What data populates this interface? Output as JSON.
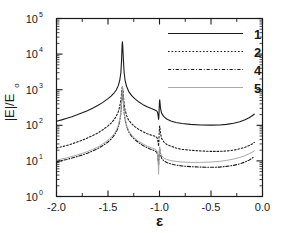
{
  "chart_data": {
    "type": "line",
    "title": "",
    "xlabel": "ε",
    "ylabel": "|E|/E",
    "ylabel_sub": "o",
    "xlim": [
      -2.0,
      0.0
    ],
    "ylim": [
      1,
      100000
    ],
    "yscale": "log",
    "xscale": "linear",
    "grid": false,
    "xticks": [
      -2.0,
      -1.5,
      -1.0,
      -0.5,
      0.0
    ],
    "xtick_labels": [
      "-2.0",
      "-1.5",
      "-1.0",
      "-0.5",
      "0.0"
    ],
    "yticks": [
      1,
      10,
      100,
      1000,
      10000,
      100000
    ],
    "ytick_labels": [
      "10",
      "10",
      "10",
      "10",
      "10",
      "10"
    ],
    "ytick_exponents": [
      "0",
      "1",
      "2",
      "3",
      "4",
      "5"
    ],
    "legend_position": "upper-right",
    "legend_entries": [
      {
        "label": "1",
        "style": "solid",
        "color": "#1a1a1a"
      },
      {
        "label": "2",
        "style": "dotted",
        "color": "#1a1a1a"
      },
      {
        "label": "4",
        "style": "dashdot",
        "color": "#1a1a1a"
      },
      {
        "label": "5",
        "style": "solid-light",
        "color": "#a8a8a8"
      }
    ],
    "resonances": [
      {
        "name": "main-peak",
        "x": -1.36,
        "peak_value": 22000
      },
      {
        "name": "secondary-peak",
        "x": -1.0,
        "peak_value": 520
      }
    ],
    "series": [
      {
        "name": "1",
        "style": "solid",
        "color": "#1a1a1a",
        "points": [
          [
            -2.0,
            130
          ],
          [
            -1.95,
            142
          ],
          [
            -1.9,
            157
          ],
          [
            -1.85,
            175
          ],
          [
            -1.8,
            197
          ],
          [
            -1.75,
            224
          ],
          [
            -1.7,
            258
          ],
          [
            -1.65,
            302
          ],
          [
            -1.6,
            360
          ],
          [
            -1.55,
            440
          ],
          [
            -1.5,
            560
          ],
          [
            -1.47,
            660
          ],
          [
            -1.44,
            820
          ],
          [
            -1.42,
            980
          ],
          [
            -1.4,
            1300
          ],
          [
            -1.385,
            1900
          ],
          [
            -1.375,
            3000
          ],
          [
            -1.368,
            7000
          ],
          [
            -1.363,
            18000
          ],
          [
            -1.36,
            22000
          ],
          [
            -1.357,
            17000
          ],
          [
            -1.35,
            6500
          ],
          [
            -1.343,
            3000
          ],
          [
            -1.335,
            1900
          ],
          [
            -1.32,
            1250
          ],
          [
            -1.3,
            900
          ],
          [
            -1.27,
            680
          ],
          [
            -1.24,
            560
          ],
          [
            -1.2,
            450
          ],
          [
            -1.16,
            380
          ],
          [
            -1.12,
            330
          ],
          [
            -1.08,
            295
          ],
          [
            -1.05,
            275
          ],
          [
            -1.035,
            262
          ],
          [
            -1.025,
            250
          ],
          [
            -1.018,
            225
          ],
          [
            -1.013,
            185
          ],
          [
            -1.009,
            145
          ],
          [
            -1.006,
            175
          ],
          [
            -1.003,
            290
          ],
          [
            -1.0,
            470
          ],
          [
            -0.998,
            520
          ],
          [
            -0.995,
            430
          ],
          [
            -0.99,
            300
          ],
          [
            -0.98,
            220
          ],
          [
            -0.96,
            178
          ],
          [
            -0.93,
            150
          ],
          [
            -0.89,
            132
          ],
          [
            -0.84,
            120
          ],
          [
            -0.78,
            112
          ],
          [
            -0.7,
            106
          ],
          [
            -0.6,
            102
          ],
          [
            -0.5,
            101
          ],
          [
            -0.42,
            102
          ],
          [
            -0.35,
            106
          ],
          [
            -0.28,
            114
          ],
          [
            -0.22,
            126
          ],
          [
            -0.17,
            143
          ],
          [
            -0.13,
            163
          ],
          [
            -0.1,
            185
          ],
          [
            -0.08,
            205
          ]
        ]
      },
      {
        "name": "2",
        "style": "dotted",
        "color": "#1a1a1a",
        "points": [
          [
            -2.0,
            23
          ],
          [
            -1.95,
            25
          ],
          [
            -1.9,
            27
          ],
          [
            -1.85,
            30
          ],
          [
            -1.8,
            34
          ],
          [
            -1.75,
            38
          ],
          [
            -1.7,
            44
          ],
          [
            -1.65,
            51
          ],
          [
            -1.6,
            61
          ],
          [
            -1.55,
            75
          ],
          [
            -1.5,
            96
          ],
          [
            -1.47,
            115
          ],
          [
            -1.44,
            145
          ],
          [
            -1.42,
            180
          ],
          [
            -1.4,
            240
          ],
          [
            -1.385,
            350
          ],
          [
            -1.375,
            520
          ],
          [
            -1.368,
            800
          ],
          [
            -1.363,
            1100
          ],
          [
            -1.36,
            1250
          ],
          [
            -1.357,
            1050
          ],
          [
            -1.35,
            650
          ],
          [
            -1.343,
            400
          ],
          [
            -1.335,
            280
          ],
          [
            -1.32,
            190
          ],
          [
            -1.3,
            140
          ],
          [
            -1.27,
            110
          ],
          [
            -1.24,
            92
          ],
          [
            -1.2,
            76
          ],
          [
            -1.16,
            66
          ],
          [
            -1.12,
            58
          ],
          [
            -1.08,
            53
          ],
          [
            -1.05,
            50
          ],
          [
            -1.035,
            48
          ],
          [
            -1.025,
            45
          ],
          [
            -1.018,
            40
          ],
          [
            -1.013,
            33
          ],
          [
            -1.009,
            26
          ],
          [
            -1.006,
            34
          ],
          [
            -1.003,
            62
          ],
          [
            -1.0,
            88
          ],
          [
            -0.998,
            96
          ],
          [
            -0.995,
            80
          ],
          [
            -0.99,
            58
          ],
          [
            -0.98,
            43
          ],
          [
            -0.96,
            35
          ],
          [
            -0.93,
            29
          ],
          [
            -0.89,
            26
          ],
          [
            -0.84,
            23
          ],
          [
            -0.78,
            21
          ],
          [
            -0.7,
            20
          ],
          [
            -0.6,
            19
          ],
          [
            -0.5,
            18.5
          ],
          [
            -0.42,
            18.5
          ],
          [
            -0.35,
            19
          ],
          [
            -0.28,
            20
          ],
          [
            -0.22,
            22
          ],
          [
            -0.17,
            24
          ],
          [
            -0.13,
            27
          ],
          [
            -0.1,
            30
          ],
          [
            -0.08,
            33
          ]
        ]
      },
      {
        "name": "4",
        "style": "dashdot",
        "color": "#1a1a1a",
        "points": [
          [
            -2.0,
            9.5
          ],
          [
            -1.95,
            10.2
          ],
          [
            -1.9,
            11.0
          ],
          [
            -1.85,
            12.0
          ],
          [
            -1.8,
            13.2
          ],
          [
            -1.75,
            14.6
          ],
          [
            -1.7,
            16.5
          ],
          [
            -1.65,
            19
          ],
          [
            -1.6,
            22
          ],
          [
            -1.55,
            27
          ],
          [
            -1.5,
            34
          ],
          [
            -1.47,
            41
          ],
          [
            -1.44,
            52
          ],
          [
            -1.42,
            65
          ],
          [
            -1.4,
            88
          ],
          [
            -1.385,
            135
          ],
          [
            -1.375,
            220
          ],
          [
            -1.368,
            420
          ],
          [
            -1.363,
            800
          ],
          [
            -1.36,
            1150
          ],
          [
            -1.357,
            900
          ],
          [
            -1.35,
            430
          ],
          [
            -1.343,
            230
          ],
          [
            -1.335,
            150
          ],
          [
            -1.32,
            95
          ],
          [
            -1.3,
            66
          ],
          [
            -1.27,
            49
          ],
          [
            -1.24,
            40
          ],
          [
            -1.2,
            32
          ],
          [
            -1.16,
            27
          ],
          [
            -1.12,
            23.5
          ],
          [
            -1.08,
            21
          ],
          [
            -1.05,
            19.5
          ],
          [
            -1.035,
            18.5
          ],
          [
            -1.025,
            17
          ],
          [
            -1.018,
            14
          ],
          [
            -1.013,
            10.5
          ],
          [
            -1.009,
            7.5
          ],
          [
            -1.006,
            10
          ],
          [
            -1.003,
            16
          ],
          [
            -1.0,
            21
          ],
          [
            -0.998,
            22
          ],
          [
            -0.995,
            19
          ],
          [
            -0.99,
            15
          ],
          [
            -0.98,
            12
          ],
          [
            -0.96,
            10.2
          ],
          [
            -0.93,
            9.0
          ],
          [
            -0.89,
            8.2
          ],
          [
            -0.84,
            7.6
          ],
          [
            -0.78,
            7.2
          ],
          [
            -0.7,
            6.9
          ],
          [
            -0.6,
            6.7
          ],
          [
            -0.5,
            6.6
          ],
          [
            -0.42,
            6.7
          ],
          [
            -0.35,
            7.0
          ],
          [
            -0.28,
            7.5
          ],
          [
            -0.22,
            8.3
          ],
          [
            -0.17,
            9.3
          ],
          [
            -0.13,
            10.5
          ],
          [
            -0.1,
            12.0
          ],
          [
            -0.08,
            13.2
          ]
        ]
      },
      {
        "name": "5",
        "style": "solid-light",
        "color": "#a8a8a8",
        "points": [
          [
            -2.0,
            10.5
          ],
          [
            -1.95,
            11.3
          ],
          [
            -1.9,
            12.2
          ],
          [
            -1.85,
            13.3
          ],
          [
            -1.8,
            14.6
          ],
          [
            -1.75,
            16.2
          ],
          [
            -1.7,
            18.3
          ],
          [
            -1.65,
            21
          ],
          [
            -1.6,
            24.5
          ],
          [
            -1.55,
            30
          ],
          [
            -1.5,
            38
          ],
          [
            -1.47,
            46
          ],
          [
            -1.44,
            58
          ],
          [
            -1.42,
            72
          ],
          [
            -1.4,
            97
          ],
          [
            -1.385,
            148
          ],
          [
            -1.375,
            240
          ],
          [
            -1.368,
            450
          ],
          [
            -1.363,
            850
          ],
          [
            -1.36,
            1200
          ],
          [
            -1.357,
            950
          ],
          [
            -1.35,
            460
          ],
          [
            -1.343,
            245
          ],
          [
            -1.335,
            160
          ],
          [
            -1.32,
            102
          ],
          [
            -1.3,
            71
          ],
          [
            -1.27,
            53
          ],
          [
            -1.24,
            43
          ],
          [
            -1.2,
            35
          ],
          [
            -1.16,
            30
          ],
          [
            -1.12,
            26
          ],
          [
            -1.08,
            23.5
          ],
          [
            -1.05,
            22
          ],
          [
            -1.035,
            21
          ],
          [
            -1.025,
            19
          ],
          [
            -1.018,
            15
          ],
          [
            -1.013,
            10
          ],
          [
            -1.009,
            4.2
          ],
          [
            -1.006,
            8
          ],
          [
            -1.003,
            16
          ],
          [
            -1.0,
            23
          ],
          [
            -0.998,
            25
          ],
          [
            -0.995,
            21
          ],
          [
            -0.99,
            17
          ],
          [
            -0.98,
            14
          ],
          [
            -0.96,
            12.2
          ],
          [
            -0.93,
            11.0
          ],
          [
            -0.89,
            10.2
          ],
          [
            -0.84,
            9.7
          ],
          [
            -0.78,
            9.3
          ],
          [
            -0.7,
            9.1
          ],
          [
            -0.6,
            9.1
          ],
          [
            -0.5,
            9.3
          ],
          [
            -0.42,
            9.7
          ],
          [
            -0.35,
            10.3
          ],
          [
            -0.28,
            11.3
          ],
          [
            -0.22,
            12.5
          ],
          [
            -0.17,
            14.0
          ],
          [
            -0.13,
            15.8
          ],
          [
            -0.1,
            17.6
          ],
          [
            -0.08,
            19.0
          ]
        ]
      }
    ]
  }
}
